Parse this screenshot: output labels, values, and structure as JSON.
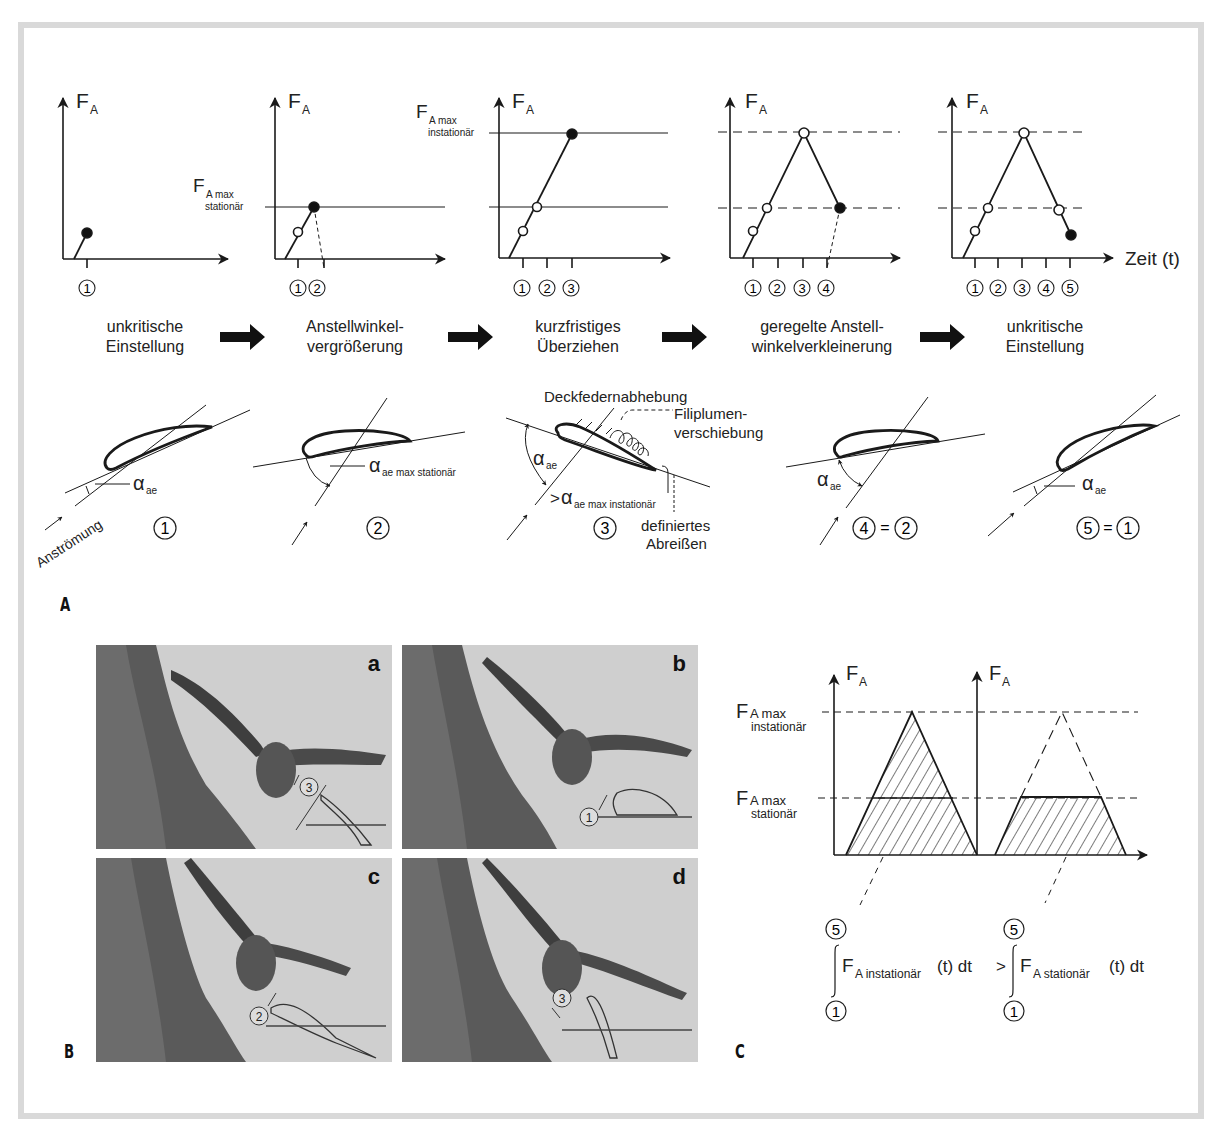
{
  "figure": {
    "panels": {
      "A": "A",
      "B": "B",
      "C": "C"
    }
  },
  "panel_A": {
    "axis_label_y": "F",
    "axis_label_y_sub": "A",
    "axis_label_x": "Zeit (t)",
    "ref_lines": {
      "max_stationaer_main": "F",
      "max_stationaer_sub1": "A max",
      "max_stationaer_sub2": "stationär",
      "max_instationaer_main": "F",
      "max_instationaer_sub1": "A max",
      "max_instationaer_sub2": "instationär"
    },
    "graphs": [
      {
        "ticks": [
          "1"
        ]
      },
      {
        "ticks": [
          "1",
          "2"
        ]
      },
      {
        "ticks": [
          "1",
          "2",
          "3"
        ]
      },
      {
        "ticks": [
          "1",
          "2",
          "3",
          "4"
        ]
      },
      {
        "ticks": [
          "1",
          "2",
          "3",
          "4",
          "5"
        ]
      }
    ],
    "stages": [
      {
        "line1": "unkritische",
        "line2": "Einstellung"
      },
      {
        "line1": "Anstellwinkel-",
        "line2": "vergrößerung"
      },
      {
        "line1": "kurzfristiges",
        "line2": "Überziehen"
      },
      {
        "line1": "geregelte Anstell-",
        "line2": "winkelverkleinerung"
      },
      {
        "line1": "unkritische",
        "line2": "Einstellung"
      }
    ],
    "airfoils": {
      "alpha": "α",
      "alpha_sub_ae": "ae",
      "alpha_sub_max_stationaer": "ae max stationär",
      "alpha_sub_max_instationaer": "ae max instationär",
      "greater": ">",
      "anstroemung": "Anströmung",
      "deckfedern": "Deckfedernabhebung",
      "filiplumen_1": "Filiplumen-",
      "filiplumen_2": "verschiebung",
      "abreissen_1": "definiertes",
      "abreissen_2": "Abreißen",
      "labels": [
        "1",
        "2",
        "3",
        "4",
        "2",
        "5",
        "1"
      ],
      "equals": "="
    }
  },
  "panel_B": {
    "photos": [
      {
        "letter": "a",
        "state": "3"
      },
      {
        "letter": "b",
        "state": "1"
      },
      {
        "letter": "c",
        "state": "2"
      },
      {
        "letter": "d",
        "state": "3"
      }
    ]
  },
  "panel_C": {
    "axis_label_y": "F",
    "axis_label_y_sub": "A",
    "max_instationaer_main": "F",
    "max_instationaer_sub1": "A max",
    "max_instationaer_sub2": "instationär",
    "max_stationaer_main": "F",
    "max_stationaer_sub1": "A max",
    "max_stationaer_sub2": "stationär",
    "formula": {
      "upper": "5",
      "lower": "1",
      "left_F": "F",
      "left_sub": "A instationär",
      "left_tail": "(t) dt",
      "relation": ">",
      "right_F": "F",
      "right_sub": "A stationär",
      "right_tail": "(t) dt"
    }
  }
}
